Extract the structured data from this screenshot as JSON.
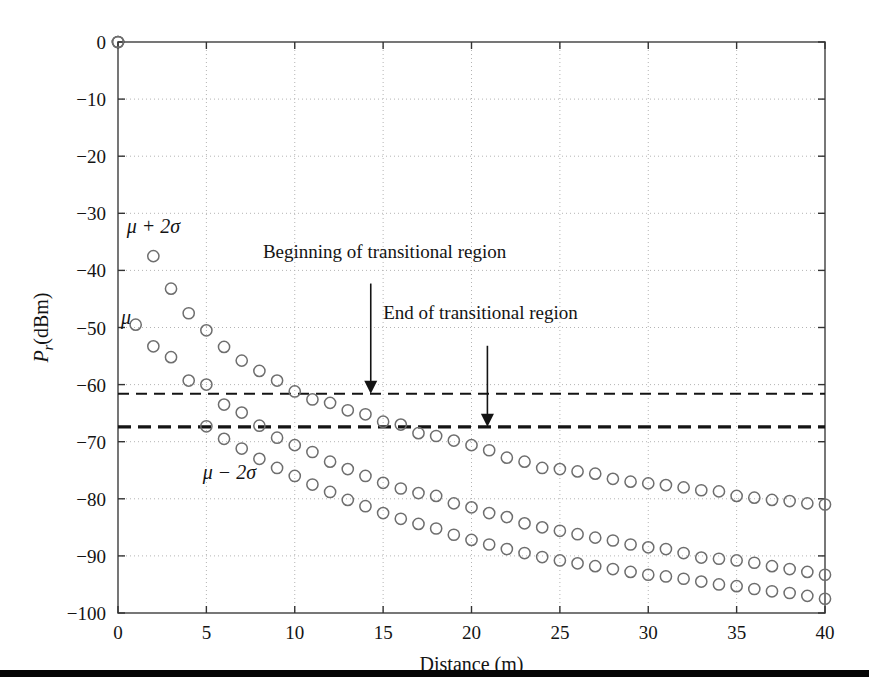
{
  "figure": {
    "background_color": "#ffffff",
    "bottom_rule": {
      "name": "bottom-rule",
      "y": 670,
      "height": 7,
      "color": "#050505"
    }
  },
  "chart_data": {
    "type": "scatter",
    "title": "",
    "subtitle": "",
    "xlabel": "Distance (m)",
    "ylabel": "P_r (dBm)",
    "ylabel_parts": {
      "p": "P",
      "sub": "r",
      "unit": "(dBm)"
    },
    "xlim": [
      0,
      40
    ],
    "ylim": [
      -100,
      0
    ],
    "xticks": [
      0,
      5,
      10,
      15,
      20,
      25,
      30,
      35,
      40
    ],
    "yticks": [
      0,
      -10,
      -20,
      -30,
      -40,
      -50,
      -60,
      -70,
      -80,
      -90,
      -100
    ],
    "xticklabels": [
      "0",
      "5",
      "10",
      "15",
      "20",
      "25",
      "30",
      "35",
      "40"
    ],
    "yticklabels": [
      "0",
      "−10",
      "−20",
      "−30",
      "−40",
      "−50",
      "−60",
      "−70",
      "−80",
      "−90",
      "−100"
    ],
    "grid": true,
    "grid_style": "dotted",
    "grid_color": "#b4b4b4",
    "legend_position": "inline-labels",
    "marker": "open-circle",
    "marker_color": "#6e6e6e",
    "series": [
      {
        "name": "μ + 2σ",
        "label": "μ + 2σ",
        "label_x": 2.0,
        "label_y": -33.5,
        "x": [
          0,
          2,
          3,
          4,
          5,
          6,
          7,
          8,
          9,
          10,
          11,
          12,
          13,
          14,
          15,
          16,
          17,
          18,
          19,
          20,
          21,
          22,
          23,
          24,
          25,
          26,
          27,
          28,
          29,
          30,
          31,
          32,
          33,
          34,
          35,
          36,
          37,
          38,
          39,
          40
        ],
        "y": [
          0,
          -37.5,
          -43.2,
          -47.5,
          -50.5,
          -53.4,
          -55.8,
          -57.6,
          -59.3,
          -61.2,
          -62.6,
          -63.2,
          -64.5,
          -65.2,
          -66.5,
          -67.0,
          -68.5,
          -69.0,
          -69.8,
          -70.6,
          -71.5,
          -72.8,
          -73.5,
          -74.6,
          -74.8,
          -75.2,
          -75.6,
          -76.5,
          -77.0,
          -77.3,
          -77.6,
          -78.0,
          -78.5,
          -78.7,
          -79.5,
          -79.8,
          -80.2,
          -80.4,
          -80.8,
          -81.0
        ]
      },
      {
        "name": "μ",
        "label": "μ",
        "label_x": 0.45,
        "label_y": -49.3,
        "x": [
          0,
          1,
          2,
          3,
          4,
          5,
          6,
          7,
          8,
          9,
          10,
          11,
          12,
          13,
          14,
          15,
          16,
          17,
          18,
          19,
          20,
          21,
          22,
          23,
          24,
          25,
          26,
          27,
          28,
          29,
          30,
          31,
          32,
          33,
          34,
          35,
          36,
          37,
          38,
          39,
          40
        ],
        "y": [
          0,
          -49.5,
          -53.3,
          -55.2,
          -59.3,
          -60.0,
          -63.5,
          -64.9,
          -67.2,
          -69.3,
          -70.6,
          -71.8,
          -73.5,
          -74.8,
          -76.0,
          -77.2,
          -78.2,
          -79.0,
          -79.5,
          -80.8,
          -81.5,
          -82.5,
          -83.2,
          -84.3,
          -85.0,
          -85.6,
          -86.2,
          -86.8,
          -87.3,
          -88.0,
          -88.5,
          -88.8,
          -89.5,
          -90.3,
          -90.5,
          -90.8,
          -91.2,
          -91.8,
          -92.3,
          -92.8,
          -93.3
        ]
      },
      {
        "name": "μ − 2σ",
        "label": "μ − 2σ",
        "label_x": 6.3,
        "label_y": -76.5,
        "x": [
          0,
          5,
          6,
          7,
          8,
          9,
          10,
          11,
          12,
          13,
          14,
          15,
          16,
          17,
          18,
          19,
          20,
          21,
          22,
          23,
          24,
          25,
          26,
          27,
          28,
          29,
          30,
          31,
          32,
          33,
          34,
          35,
          36,
          37,
          38,
          39,
          40
        ],
        "y": [
          0,
          -67.3,
          -69.5,
          -71.2,
          -73.0,
          -74.6,
          -76.0,
          -77.5,
          -78.8,
          -80.2,
          -81.3,
          -82.5,
          -83.5,
          -84.4,
          -85.2,
          -86.3,
          -87.2,
          -88.0,
          -88.8,
          -89.5,
          -90.2,
          -90.8,
          -91.3,
          -91.8,
          -92.3,
          -92.8,
          -93.3,
          -93.6,
          -94.0,
          -94.5,
          -95.0,
          -95.3,
          -95.8,
          -96.2,
          -96.5,
          -97.0,
          -97.5
        ]
      }
    ],
    "threshold_lines": [
      {
        "name": "beginning-of-transitional-region-line",
        "y": -61.6,
        "style": "dashed",
        "linewidth": 2.0,
        "color": "#141414"
      },
      {
        "name": "end-of-transitional-region-line",
        "y": -67.4,
        "style": "dashed",
        "linewidth": 3.2,
        "color": "#141414"
      }
    ],
    "annotations": [
      {
        "name": "beginning-of-transitional-region",
        "text": "Beginning of transitional region",
        "text_x": 8.2,
        "text_y": -37.8,
        "arrow_x": 14.3,
        "arrow_y_start": -42.3,
        "arrow_y_end": -61.6
      },
      {
        "name": "end-of-transitional-region",
        "text": "End of transitional region",
        "text_x": 15.0,
        "text_y": -48.5,
        "arrow_x": 20.9,
        "arrow_y_start": -53.2,
        "arrow_y_end": -67.4
      }
    ]
  }
}
